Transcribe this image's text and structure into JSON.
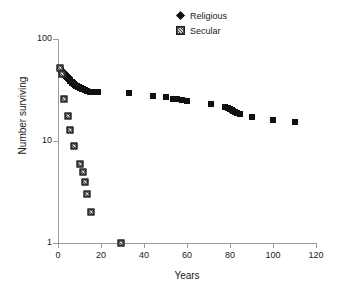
{
  "chart_data": {
    "type": "scatter",
    "title": "",
    "xlabel": "Years",
    "ylabel": "Number surviving",
    "xlim": [
      0,
      120
    ],
    "ylim": [
      1,
      100
    ],
    "yscale": "log",
    "grid": false,
    "legend_position": "top-center",
    "xticks": [
      0,
      20,
      40,
      60,
      80,
      100,
      120
    ],
    "yticks": [
      1,
      10,
      100
    ],
    "xtick_labels": [
      "0",
      "20",
      "40",
      "60",
      "80",
      "100",
      "120"
    ],
    "ytick_labels": [
      "1",
      "10",
      "100"
    ],
    "series": [
      {
        "name": "Religious",
        "marker": "diamond",
        "color": "#111111",
        "points": [
          [
            1.0,
            52.0
          ],
          [
            1.6,
            50.0
          ],
          [
            2.0,
            48.0
          ],
          [
            2.4,
            46.5
          ],
          [
            2.9,
            45.0
          ],
          [
            3.3,
            44.0
          ],
          [
            3.7,
            43.0
          ],
          [
            4.1,
            42.0
          ],
          [
            4.6,
            41.0
          ],
          [
            5.0,
            40.2
          ],
          [
            5.4,
            39.4
          ],
          [
            5.8,
            38.6
          ],
          [
            6.3,
            38.0
          ],
          [
            6.7,
            37.4
          ],
          [
            7.1,
            36.8
          ],
          [
            7.5,
            36.2
          ],
          [
            8.0,
            35.6
          ],
          [
            8.4,
            35.0
          ],
          [
            8.8,
            34.5
          ],
          [
            9.2,
            34.0
          ],
          [
            9.7,
            33.6
          ],
          [
            10.1,
            33.2
          ],
          [
            10.5,
            32.8
          ],
          [
            11.0,
            32.4
          ],
          [
            11.6,
            32.0
          ],
          [
            12.4,
            31.6
          ],
          [
            13.5,
            31.2
          ],
          [
            15.0,
            30.5
          ],
          [
            16.8,
            30.2
          ],
          [
            18.5,
            30.0
          ],
          [
            33.0,
            29.5
          ],
          [
            44.0,
            27.5
          ],
          [
            50.0,
            27.0
          ],
          [
            53.5,
            26.0
          ],
          [
            55.5,
            25.6
          ],
          [
            57.5,
            25.3
          ],
          [
            60.0,
            24.6
          ],
          [
            71.0,
            23.2
          ],
          [
            77.5,
            21.6
          ],
          [
            79.0,
            21.0
          ],
          [
            80.0,
            20.5
          ],
          [
            80.8,
            20.0
          ],
          [
            81.6,
            19.6
          ],
          [
            82.4,
            19.2
          ],
          [
            83.2,
            18.8
          ],
          [
            84.5,
            18.4
          ],
          [
            90.0,
            17.3
          ],
          [
            100.0,
            16.2
          ],
          [
            110.0,
            15.3
          ]
        ]
      },
      {
        "name": "Secular",
        "marker": "square",
        "color": "#4a4a4a",
        "points": [
          [
            1.0,
            52.0
          ],
          [
            2.0,
            45.0
          ],
          [
            3.0,
            26.0
          ],
          [
            4.5,
            17.5
          ],
          [
            5.5,
            12.8
          ],
          [
            7.5,
            9.0
          ],
          [
            10.0,
            6.0
          ],
          [
            11.5,
            5.0
          ],
          [
            12.5,
            4.0
          ],
          [
            13.5,
            3.0
          ],
          [
            15.5,
            2.0
          ],
          [
            29.5,
            1.0
          ]
        ]
      }
    ]
  },
  "legend": {
    "items": [
      {
        "label": "Religious",
        "marker": "diamond"
      },
      {
        "label": "Secular",
        "marker": "square"
      }
    ]
  }
}
